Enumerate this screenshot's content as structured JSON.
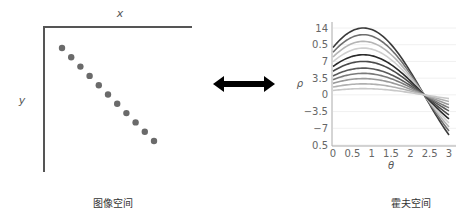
{
  "image_space": {
    "x_label": "x",
    "y_label": "y",
    "caption": "图像空间",
    "point_color": "#6a6a6a",
    "axis_color": "#555555",
    "points": [
      [
        0,
        0
      ],
      [
        1,
        1
      ],
      [
        2,
        2
      ],
      [
        3,
        3
      ],
      [
        4,
        4
      ],
      [
        5,
        5
      ],
      [
        6,
        6
      ],
      [
        7,
        7
      ],
      [
        8,
        8
      ],
      [
        9,
        9
      ],
      [
        10,
        10
      ]
    ]
  },
  "arrow": {
    "icon": "double-headed-arrow-icon",
    "color": "#000000"
  },
  "hough_space": {
    "caption": "霍夫空间"
  },
  "chart_data": {
    "type": "line",
    "title": "",
    "xlabel": "θ",
    "ylabel": "ρ",
    "xlim": [
      0,
      3
    ],
    "ylim": [
      -10.5,
      14
    ],
    "x_ticks": [
      0,
      0.5,
      1,
      1.5,
      2,
      2.5,
      3
    ],
    "x_tick_labels": [
      "0",
      "0.5",
      "1",
      "1.5",
      "2",
      "2.5",
      "3"
    ],
    "y_ticks": [
      14,
      10.5,
      7,
      3.5,
      0,
      -3.5,
      -7,
      -10.5
    ],
    "y_tick_labels": [
      "14",
      "0.5",
      "7",
      "3.5",
      "0",
      "−3.5",
      "−7",
      "0.5"
    ],
    "grid": true,
    "formula": "rho = A * cos(theta - 0.785)",
    "intersection": {
      "theta": 2.36,
      "rho": 0
    },
    "series": [
      {
        "name": "curve-1",
        "amplitude": 14.0,
        "color": "#3a3a3a"
      },
      {
        "name": "curve-2",
        "amplitude": 12.6,
        "color": "#6e6e6e"
      },
      {
        "name": "curve-3",
        "amplitude": 11.2,
        "color": "#b5b5b5"
      },
      {
        "name": "curve-4",
        "amplitude": 9.8,
        "color": "#cfcfcf"
      },
      {
        "name": "curve-5",
        "amplitude": 8.4,
        "color": "#2a2a2a"
      },
      {
        "name": "curve-6",
        "amplitude": 7.0,
        "color": "#4a4a4a"
      },
      {
        "name": "curve-7",
        "amplitude": 5.6,
        "color": "#5a5a5a"
      },
      {
        "name": "curve-8",
        "amplitude": 4.5,
        "color": "#7a7a7a"
      },
      {
        "name": "curve-9",
        "amplitude": 3.4,
        "color": "#9a9a9a"
      },
      {
        "name": "curve-10",
        "amplitude": 2.3,
        "color": "#b0b0b0"
      },
      {
        "name": "curve-11",
        "amplitude": 1.3,
        "color": "#c8c8c8"
      }
    ]
  }
}
